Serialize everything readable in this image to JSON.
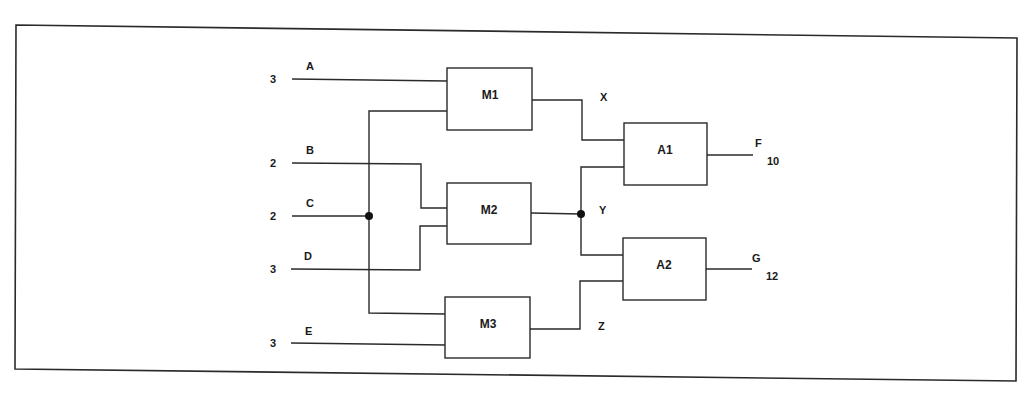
{
  "diagram": {
    "type": "block-circuit",
    "inputs": [
      {
        "name": "A",
        "weight": "3"
      },
      {
        "name": "B",
        "weight": "2"
      },
      {
        "name": "C",
        "weight": "2"
      },
      {
        "name": "D",
        "weight": "3"
      },
      {
        "name": "E",
        "weight": "3"
      }
    ],
    "blocks": [
      {
        "id": "M1",
        "label": "M1"
      },
      {
        "id": "M2",
        "label": "M2"
      },
      {
        "id": "M3",
        "label": "M3"
      },
      {
        "id": "A1",
        "label": "A1"
      },
      {
        "id": "A2",
        "label": "A2"
      }
    ],
    "intermediates": [
      {
        "name": "X"
      },
      {
        "name": "Y"
      },
      {
        "name": "Z"
      }
    ],
    "outputs": [
      {
        "name": "F",
        "value": "10"
      },
      {
        "name": "G",
        "value": "12"
      }
    ],
    "connections": [
      {
        "from": "A",
        "to": "M1"
      },
      {
        "from": "C",
        "to": "M1"
      },
      {
        "from": "B",
        "to": "M2"
      },
      {
        "from": "D",
        "to": "M2"
      },
      {
        "from": "C",
        "to": "M3"
      },
      {
        "from": "E",
        "to": "M3"
      },
      {
        "from": "M1",
        "to": "A1",
        "via": "X"
      },
      {
        "from": "M2",
        "to": "A1",
        "via": "Y"
      },
      {
        "from": "M2",
        "to": "A2",
        "via": "Y"
      },
      {
        "from": "M3",
        "to": "A2",
        "via": "Z"
      },
      {
        "from": "A1",
        "to": "F"
      },
      {
        "from": "A2",
        "to": "G"
      }
    ]
  }
}
